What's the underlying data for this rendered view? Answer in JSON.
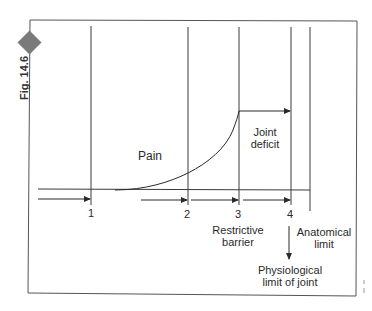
{
  "figure": {
    "label": "Fig. 14.6",
    "marker_color": "#7a7a7a"
  },
  "diagram": {
    "markers": [
      {
        "id": "1",
        "label": "1"
      },
      {
        "id": "2",
        "label": "2"
      },
      {
        "id": "3",
        "label": "3"
      },
      {
        "id": "4",
        "label": "4"
      }
    ],
    "labels": {
      "pain": "Pain",
      "joint_deficit_line1": "Joint",
      "joint_deficit_line2": "deficit",
      "restrictive_line1": "Restrictive",
      "restrictive_line2": "barrier",
      "anatomical_line1": "Anatomical",
      "anatomical_line2": "limit",
      "physiological_line1": "Physiological",
      "physiological_line2": "limit of joint"
    },
    "colors": {
      "line": "#3a3a3a",
      "frame": "#555555",
      "background": "#ffffff"
    }
  }
}
